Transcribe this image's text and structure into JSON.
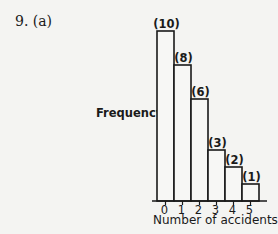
{
  "problem": {
    "label": "9.  (a)"
  },
  "chart_data": {
    "type": "bar",
    "title": "",
    "xlabel": "Number of accidents",
    "ylabel": "Frequency",
    "categories": [
      "0",
      "1",
      "2",
      "3",
      "4",
      "5"
    ],
    "values": [
      10,
      8,
      6,
      3,
      2,
      1
    ],
    "data_labels": [
      "(10)",
      "(8)",
      "(6)",
      "(3)",
      "(2)",
      "(1)"
    ],
    "ylim": [
      0,
      10
    ],
    "grid": false,
    "legend": null,
    "style": "histogram (adjacent bars, no y-axis ticks)"
  }
}
